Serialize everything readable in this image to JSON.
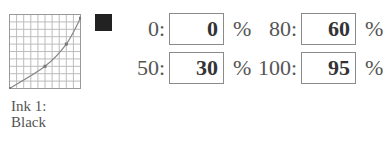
{
  "ink": {
    "label_line1": "Ink 1:",
    "label_line2": "Black",
    "swatch_color": "#222222"
  },
  "curve": {
    "grid_divisions": 10,
    "points": [
      {
        "input": 0,
        "output": 0
      },
      {
        "input": 50,
        "output": 30
      },
      {
        "input": 80,
        "output": 60
      },
      {
        "input": 100,
        "output": 95
      }
    ]
  },
  "fields": [
    {
      "label": "0:",
      "value": "0",
      "unit": "%"
    },
    {
      "label": "50:",
      "value": "30",
      "unit": "%"
    },
    {
      "label": "80:",
      "value": "60",
      "unit": "%"
    },
    {
      "label": "100:",
      "value": "95",
      "unit": "%"
    }
  ]
}
